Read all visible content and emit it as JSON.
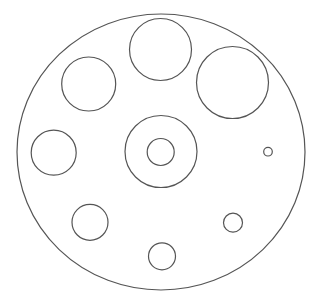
{
  "canvas": {
    "width": 318,
    "height": 306,
    "background": "#ffffff"
  },
  "style": {
    "stroke": "#555555",
    "stroke_width": 1.2
  },
  "outer": {
    "cx": 161,
    "cy": 152,
    "rx": 144,
    "ry": 138
  },
  "circles": [
    {
      "id": "top",
      "cx": 160.5,
      "cy": 49.5,
      "r": 31
    },
    {
      "id": "top-right",
      "cx": 232.5,
      "cy": 82.5,
      "r": 36
    },
    {
      "id": "top-left",
      "cx": 88.7,
      "cy": 84,
      "r": 27
    },
    {
      "id": "left-middle",
      "cx": 53.7,
      "cy": 152.7,
      "r": 22.5
    },
    {
      "id": "center-ring-outer",
      "cx": 161,
      "cy": 151.5,
      "r": 36
    },
    {
      "id": "center-ring-inner",
      "cx": 160.7,
      "cy": 152,
      "r": 13.5
    },
    {
      "id": "right-small",
      "cx": 268,
      "cy": 151.7,
      "r": 4.3
    },
    {
      "id": "bottom-left",
      "cx": 90,
      "cy": 222.3,
      "r": 18
    },
    {
      "id": "bottom-right",
      "cx": 233,
      "cy": 222.7,
      "r": 9.5
    },
    {
      "id": "bottom-center",
      "cx": 162,
      "cy": 256.3,
      "r": 13.5
    }
  ]
}
